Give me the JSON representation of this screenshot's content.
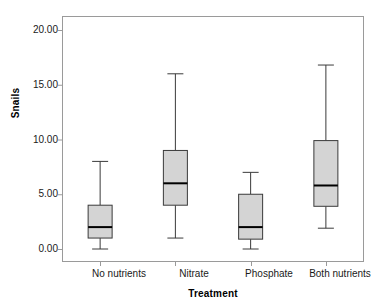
{
  "chart_data": {
    "type": "box",
    "title": "",
    "xlabel": "Treatment",
    "ylabel": "Snails",
    "categories": [
      "No nutrients",
      "Nitrate",
      "Phosphate",
      "Both nutrients"
    ],
    "ylim": [
      0,
      20
    ],
    "yticks": [
      0,
      5,
      10,
      15,
      20
    ],
    "ytick_labels": [
      "0.00",
      "5.00",
      "10.00",
      "15.00",
      "20.00"
    ],
    "grid": false,
    "legend": "none",
    "box_fill_color": "#d4d4d4",
    "box_line_color": "#3a3a3a",
    "median_line_color": "#000000",
    "frame_color": "#9a9a9a",
    "boxes": [
      {
        "category": "No nutrients",
        "min": 0.0,
        "q1": 1.0,
        "median": 2.0,
        "q3": 4.0,
        "max": 8.0
      },
      {
        "category": "Nitrate",
        "min": 1.0,
        "q1": 4.0,
        "median": 6.0,
        "q3": 9.0,
        "max": 16.0
      },
      {
        "category": "Phosphate",
        "min": 0.0,
        "q1": 0.9,
        "median": 2.0,
        "q3": 5.0,
        "max": 7.0
      },
      {
        "category": "Both nutrients",
        "min": 1.9,
        "q1": 3.9,
        "median": 5.8,
        "q3": 9.9,
        "max": 16.8
      }
    ]
  },
  "axes": {
    "x_title": "Treatment",
    "y_title": "Snails",
    "y_labels": [
      "20.00",
      "15.00",
      "10.00",
      "5.00",
      "0.00"
    ],
    "x_labels": [
      "No nutrients",
      "Nitrate",
      "Phosphate",
      "Both nutrients"
    ]
  }
}
